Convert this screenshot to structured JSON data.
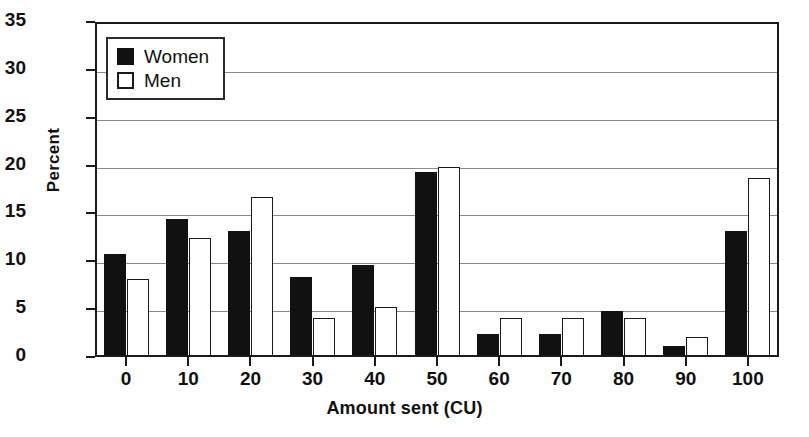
{
  "chart_data": {
    "type": "bar",
    "title": "",
    "xlabel": "Amount sent (CU)",
    "ylabel": "Percent",
    "categories": [
      "0",
      "10",
      "20",
      "30",
      "40",
      "50",
      "60",
      "70",
      "80",
      "90",
      "100"
    ],
    "series": [
      {
        "name": "Women",
        "color": "#111111",
        "values": [
          10.8,
          14.4,
          13.2,
          8.4,
          9.6,
          19.3,
          2.4,
          2.4,
          4.8,
          1.2,
          13.2
        ]
      },
      {
        "name": "Men",
        "color": "#ffffff",
        "values": [
          8.2,
          12.4,
          16.7,
          4.1,
          5.2,
          19.9,
          4.1,
          4.1,
          4.1,
          2.1,
          18.7
        ]
      }
    ],
    "ylim": [
      0,
      35
    ],
    "ytick_labels": [
      "0",
      "5",
      "10",
      "15",
      "20",
      "25",
      "30",
      "35"
    ],
    "ytick_values": [
      0,
      5,
      10,
      15,
      20,
      25,
      30,
      35
    ],
    "grid": true,
    "grid_axis": "y",
    "legend_position": "upper-left",
    "legend_entries": [
      "Women",
      "Men"
    ]
  }
}
